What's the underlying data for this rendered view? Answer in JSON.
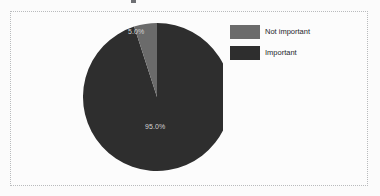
{
  "chart_data": {
    "type": "pie",
    "title": "",
    "categories": [
      "Important",
      "Not important"
    ],
    "values": [
      95.0,
      5.0
    ],
    "labels": [
      "95.0%",
      "5.0%"
    ],
    "colors": [
      "#2e2e2e",
      "#6b6b6b"
    ],
    "legend_position": "right",
    "grid": false,
    "start_angle_deg": 90,
    "direction": "counterclockwise",
    "slices": [
      {
        "name": "Not important",
        "value": 5.0,
        "label": "5.0%",
        "color": "#6b6b6b",
        "label_color": "#d2d2d2"
      },
      {
        "name": "Important",
        "value": 95.0,
        "label": "95.0%",
        "color": "#2e2e2e",
        "label_color": "#d2d2d2"
      }
    ]
  },
  "figure": {
    "background": "#fbfbfb",
    "panel_background": "#fcfcfc",
    "border_color": "#b9bbbd",
    "border_style": "dotted"
  },
  "legend": {
    "entries": [
      {
        "label": "Not important",
        "color": "#6b6b6b"
      },
      {
        "label": "Important",
        "color": "#2e2e2e"
      }
    ]
  }
}
